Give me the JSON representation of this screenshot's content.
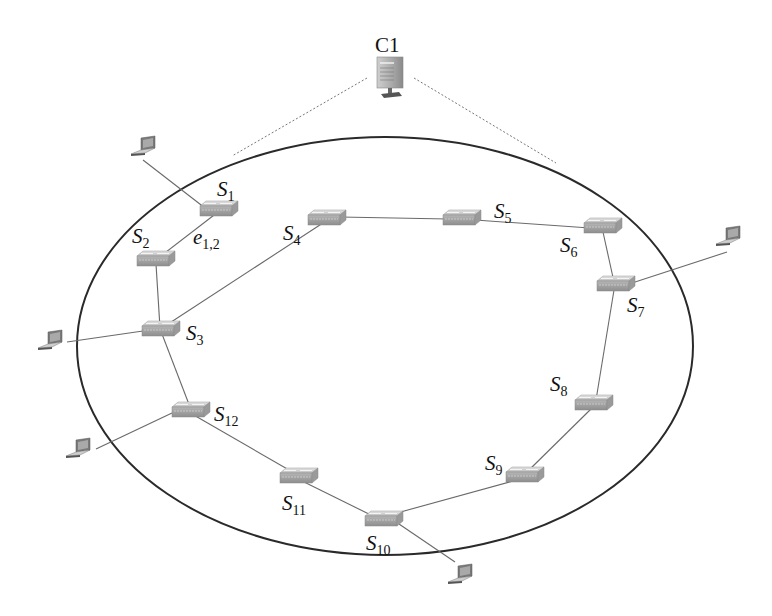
{
  "diagram": {
    "type": "network-topology",
    "controller": {
      "id": "C1",
      "label": "C1",
      "icon": "server-icon",
      "x": 390,
      "y": 78
    },
    "ring": {
      "cx": 385,
      "cy": 346,
      "rx": 308,
      "ry": 209,
      "color": "#2a2a2a"
    },
    "switches": [
      {
        "id": "S1",
        "label": "S",
        "sub": "1",
        "x": 218,
        "y": 210,
        "lx": 218,
        "ly": 196
      },
      {
        "id": "S2",
        "label": "S",
        "sub": "2",
        "x": 155,
        "y": 260,
        "lx": 133,
        "ly": 243
      },
      {
        "id": "S3",
        "label": "S",
        "sub": "3",
        "x": 160,
        "y": 330,
        "lx": 187,
        "ly": 340
      },
      {
        "id": "S4",
        "label": "S",
        "sub": "4",
        "x": 326,
        "y": 219,
        "lx": 283,
        "ly": 240
      },
      {
        "id": "S5",
        "label": "S",
        "sub": "5",
        "x": 461,
        "y": 219,
        "lx": 494,
        "ly": 218
      },
      {
        "id": "S6",
        "label": "S",
        "sub": "6",
        "x": 602,
        "y": 227,
        "lx": 560,
        "ly": 252
      },
      {
        "id": "S7",
        "label": "S",
        "sub": "7",
        "x": 615,
        "y": 285,
        "lx": 627,
        "ly": 312
      },
      {
        "id": "S8",
        "label": "S",
        "sub": "8",
        "x": 593,
        "y": 404,
        "lx": 550,
        "ly": 391
      },
      {
        "id": "S9",
        "label": "S",
        "sub": "9",
        "x": 524,
        "y": 476,
        "lx": 485,
        "ly": 470
      },
      {
        "id": "S10",
        "label": "S",
        "sub": "10",
        "x": 383,
        "y": 520,
        "lx": 366,
        "ly": 550
      },
      {
        "id": "S11",
        "label": "S",
        "sub": "11",
        "x": 298,
        "y": 477,
        "lx": 282,
        "ly": 510
      },
      {
        "id": "S12",
        "label": "S",
        "sub": "12",
        "x": 190,
        "y": 411,
        "lx": 214,
        "ly": 421
      }
    ],
    "hosts": [
      {
        "id": "H1",
        "icon": "laptop-icon",
        "x": 145,
        "y": 150,
        "attached_to": "S1"
      },
      {
        "id": "H2",
        "icon": "laptop-icon",
        "x": 730,
        "y": 236,
        "attached_to": "S7"
      },
      {
        "id": "H3",
        "icon": "laptop-icon",
        "x": 50,
        "y": 342,
        "attached_to": "S3"
      },
      {
        "id": "H4",
        "icon": "laptop-icon",
        "x": 78,
        "y": 450,
        "attached_to": "S12"
      },
      {
        "id": "H5",
        "icon": "laptop-icon",
        "x": 460,
        "y": 578,
        "attached_to": "S10"
      }
    ],
    "links": [
      [
        "S1",
        "S2"
      ],
      [
        "S2",
        "S3"
      ],
      [
        "S3",
        "S4"
      ],
      [
        "S4",
        "S5"
      ],
      [
        "S5",
        "S6"
      ],
      [
        "S6",
        "S7"
      ],
      [
        "S7",
        "S8"
      ],
      [
        "S8",
        "S9"
      ],
      [
        "S9",
        "S10"
      ],
      [
        "S10",
        "S11"
      ],
      [
        "S11",
        "S12"
      ],
      [
        "S12",
        "S3"
      ]
    ],
    "edge_label": {
      "text": "e",
      "sub": "1,2",
      "x": 193,
      "y": 243
    },
    "control_links": [
      {
        "from": [
          367,
          78
        ],
        "to": [
          232,
          156
        ]
      },
      {
        "from": [
          414,
          78
        ],
        "to": [
          556,
          163
        ]
      }
    ]
  }
}
